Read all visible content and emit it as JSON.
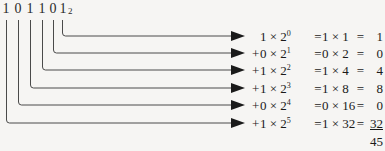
{
  "figure": {
    "background_color": "#f6f5f3",
    "line_color": "#4a4a4a",
    "text_color": "#1a1a1a"
  },
  "binary": {
    "digits": [
      "1",
      "0",
      "1",
      "1",
      "0",
      "1"
    ],
    "base_subscript": "2",
    "value_text": "101101"
  },
  "equations": [
    {
      "sign": "",
      "bit": "1",
      "times": "×",
      "base": "2",
      "exponent": "0",
      "expr": "1 × 2",
      "eq1": "=",
      "product": "1 × 1",
      "eq2": "=",
      "value": "1",
      "underlined": false
    },
    {
      "sign": "+",
      "bit": "0",
      "times": "×",
      "base": "2",
      "exponent": "1",
      "expr": "0 × 2",
      "eq1": "=",
      "product": "0 × 2",
      "eq2": "=",
      "value": "0",
      "underlined": false
    },
    {
      "sign": "+",
      "bit": "1",
      "times": "×",
      "base": "2",
      "exponent": "2",
      "expr": "1 × 2",
      "eq1": "=",
      "product": "1 × 4",
      "eq2": "=",
      "value": "4",
      "underlined": false
    },
    {
      "sign": "+",
      "bit": "1",
      "times": "×",
      "base": "2",
      "exponent": "3",
      "expr": "1 × 2",
      "eq1": "=",
      "product": "1 × 8",
      "eq2": "=",
      "value": "8",
      "underlined": false
    },
    {
      "sign": "+",
      "bit": "0",
      "times": "×",
      "base": "2",
      "exponent": "4",
      "expr": "0 × 2",
      "eq1": "=",
      "product": "0 × 16",
      "eq2": "=",
      "value": "0",
      "underlined": false
    },
    {
      "sign": "+",
      "bit": "1",
      "times": "×",
      "base": "2",
      "exponent": "5",
      "expr": "1 × 2",
      "eq1": "=",
      "product": "1 × 32",
      "eq2": "=",
      "value": "32",
      "underlined": true
    }
  ],
  "total": {
    "value": "45"
  }
}
